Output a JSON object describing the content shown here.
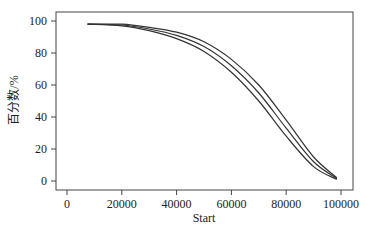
{
  "chart_data": {
    "type": "line",
    "title": "",
    "xlabel": "Start",
    "ylabel": "百分数/%",
    "xlim": [
      -4000,
      104000
    ],
    "ylim": [
      -4,
      106
    ],
    "xticks": [
      0,
      20000,
      40000,
      60000,
      80000,
      100000
    ],
    "xtick_labels": [
      "0",
      "20000",
      "40000",
      "60000",
      "80000",
      "100000"
    ],
    "yticks": [
      0,
      20,
      40,
      60,
      80,
      100
    ],
    "ytick_labels": [
      "0",
      "20",
      "40",
      "60",
      "80",
      "100"
    ],
    "grid": false,
    "legend": null,
    "line_color": "#333333",
    "series": [
      {
        "name": "curve-upper",
        "x": [
          7500,
          20000,
          30000,
          40000,
          50000,
          60000,
          70000,
          80000,
          90000,
          98500
        ],
        "y": [
          98,
          98,
          96,
          93,
          87,
          76,
          60,
          38,
          15,
          2
        ]
      },
      {
        "name": "curve-middle",
        "x": [
          7500,
          20000,
          30000,
          40000,
          50000,
          60000,
          70000,
          80000,
          90000,
          98500
        ],
        "y": [
          98,
          97.5,
          95,
          91,
          84,
          72,
          55,
          33,
          12,
          1.5
        ]
      },
      {
        "name": "curve-lower",
        "x": [
          7500,
          20000,
          30000,
          40000,
          50000,
          60000,
          70000,
          80000,
          90000,
          98500
        ],
        "y": [
          98,
          97,
          94,
          89,
          81,
          68,
          50,
          28,
          9,
          1
        ]
      }
    ]
  }
}
